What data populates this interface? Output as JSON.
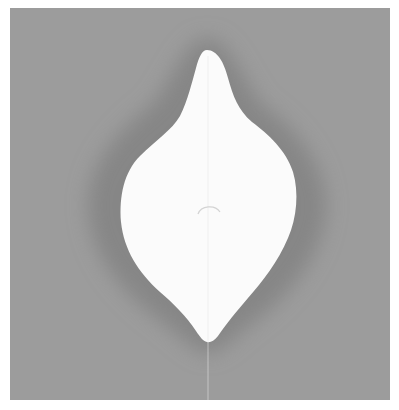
{
  "image": {
    "subject": "white pointed oval (leaf/droplet) shape with darker halo on gray background",
    "colors": {
      "page": "#ffffff",
      "background": "#9c9c9c",
      "halo": "#868686",
      "shape": "#fbfbfb",
      "center_mark": "#d8d8d8"
    }
  }
}
